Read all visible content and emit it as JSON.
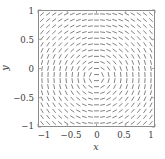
{
  "chart_data": {
    "type": "scatter",
    "subtype": "slope-field",
    "title": "",
    "xlabel": "x",
    "ylabel": "y",
    "xlim": [
      -1,
      1
    ],
    "ylim": [
      -1,
      1
    ],
    "xticks": [
      -1,
      -0.5,
      0,
      0.5,
      1
    ],
    "yticks": [
      -1,
      -0.5,
      0,
      0.5,
      1
    ],
    "xtick_labels": [
      "−1",
      "−0.5",
      "0",
      "0.5",
      "1"
    ],
    "ytick_labels": [
      "−1",
      "−0.5",
      "0",
      "0.5",
      "1"
    ],
    "grid": false,
    "legend": "none",
    "grid_nx": 19,
    "grid_ny": 19,
    "slope_formula": "dy/dx = -x/(y+0.15)",
    "segment_length": 0.085,
    "segment_color": "#4a4a4a",
    "segment_width": 0.7,
    "frame_color": "#8c8c8c",
    "background": "#ffffff",
    "annotations": []
  },
  "axes": {
    "xlabel": "x",
    "ylabel": "y",
    "xtick_labels": [
      "−1",
      "−0.5",
      "0",
      "0.5",
      "1"
    ],
    "ytick_labels": [
      "1",
      "0.5",
      "0",
      "−0.5",
      "−1"
    ]
  },
  "colors": {
    "frame": "#8c8c8c",
    "segment": "#4a4a4a",
    "text": "#3a3a3a",
    "background": "#ffffff"
  }
}
